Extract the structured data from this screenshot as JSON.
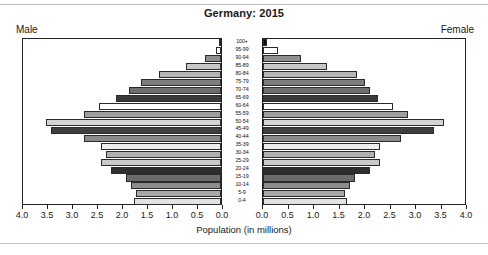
{
  "chart_data": {
    "type": "bar",
    "subtype": "population-pyramid",
    "title": "Germany: 2015",
    "xlabel": "Population (in millions)",
    "ylabel": "",
    "grid": false,
    "legend_position": "none",
    "left_panel_label": "Male",
    "right_panel_label": "Female",
    "xlim_left": [
      4.0,
      0.0
    ],
    "xlim_right": [
      0.0,
      4.0
    ],
    "xticks_left": [
      "4.0",
      "3.5",
      "3.0",
      "2.5",
      "2.0",
      "1.5",
      "1.0",
      "0.5",
      "0.0"
    ],
    "xticks_right": [
      "0.0",
      "0.5",
      "1.0",
      "1.5",
      "2.0",
      "2.5",
      "3.0",
      "3.5",
      "4.0"
    ],
    "categories": [
      "100+",
      "95-99",
      "90-94",
      "85-89",
      "80-84",
      "75-79",
      "70-74",
      "65-69",
      "60-64",
      "55-59",
      "50-54",
      "45-49",
      "40-44",
      "35-39",
      "30-34",
      "25-29",
      "20-24",
      "15-19",
      "10-14",
      "5-9",
      "0-4"
    ],
    "series": [
      {
        "name": "Male",
        "values": [
          0.02,
          0.1,
          0.33,
          0.7,
          1.25,
          1.6,
          1.85,
          2.1,
          2.45,
          2.75,
          3.5,
          3.4,
          2.75,
          2.4,
          2.3,
          2.4,
          2.2,
          1.9,
          1.8,
          1.7,
          1.75
        ]
      },
      {
        "name": "Female",
        "values": [
          0.08,
          0.3,
          0.75,
          1.25,
          1.85,
          2.0,
          2.1,
          2.25,
          2.55,
          2.85,
          3.55,
          3.35,
          2.7,
          2.3,
          2.2,
          2.3,
          2.1,
          1.8,
          1.7,
          1.6,
          1.65
        ]
      }
    ],
    "bar_fills": [
      "#0d0d0d",
      "#ffffff",
      "#8f8f8f",
      "#c7c7c7",
      "#b5b5b5",
      "#7d7d7d",
      "#6e6e6e",
      "#3a3a3a",
      "#ffffff",
      "#9e9e9e",
      "#d4d4d4",
      "#3f3f3f",
      "#8a8a8a",
      "#ededed",
      "#b0b0b0",
      "#c9c9c9",
      "#2e2e2e",
      "#6b6b6b",
      "#8c8c8c",
      "#a8a8a8",
      "#e3e3e3"
    ]
  }
}
